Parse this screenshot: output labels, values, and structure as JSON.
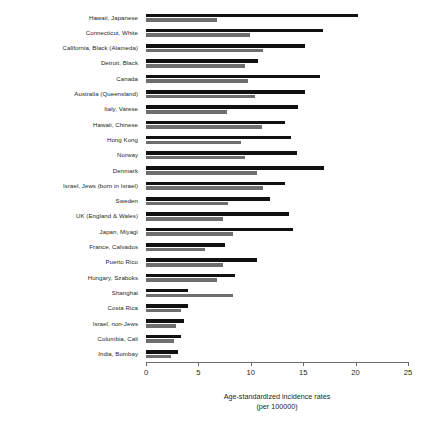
{
  "chart_data": {
    "type": "bar",
    "orientation": "horizontal",
    "title": "",
    "subtitle": "",
    "xlabel": "Age-standardized incidence rates (per 100000)",
    "xlabel_line1": "Age-standardized incidence rates",
    "xlabel_line2": "(per 100000)",
    "ylabel": "",
    "xlim": [
      0,
      25
    ],
    "xticks": [
      0,
      5,
      10,
      15,
      20,
      25
    ],
    "xtick_labels": [
      "0",
      "5",
      "10",
      "15",
      "20",
      "25"
    ],
    "grid": false,
    "legend": "none",
    "categories": [
      "Hawaii, Japanese",
      "Connecticut, White",
      "California, Black (Alameda)",
      "Detroit, Black",
      "Canada",
      "Australia (Queensland)",
      "Italy, Varese",
      "Hawaii, Chinese",
      "Hong Kong",
      "Norway",
      "Denmark",
      "Israel, Jews (born in Israel)",
      "Sweden",
      "UK (England & Wales)",
      "Japan, Miyagi",
      "France, Calvados",
      "Puerto Rico",
      "Hungary, Szaboks",
      "Shanghai",
      "Costa Rica",
      "Israel, non-Jews",
      "Columbia, Cali",
      "India, Bombay"
    ],
    "series": [
      {
        "name": "upper-bar",
        "color": "#111111",
        "values": [
          20.2,
          16.9,
          15.2,
          10.7,
          16.6,
          15.2,
          14.5,
          13.3,
          13.8,
          14.4,
          17.0,
          13.3,
          11.8,
          13.6,
          14.0,
          7.5,
          10.6,
          8.5,
          4.0,
          4.0,
          3.6,
          3.3,
          3.1
        ]
      },
      {
        "name": "lower-bar",
        "color": "#6e6e6e",
        "values": [
          6.8,
          9.9,
          11.2,
          9.4,
          9.7,
          10.4,
          7.7,
          11.1,
          9.1,
          9.4,
          10.6,
          11.2,
          7.8,
          7.3,
          8.3,
          5.6,
          7.3,
          6.8,
          8.3,
          3.3,
          2.9,
          2.7,
          2.4
        ]
      }
    ]
  }
}
